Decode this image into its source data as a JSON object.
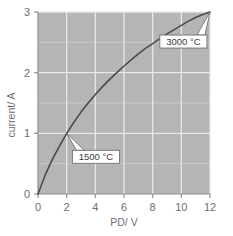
{
  "chart_data": {
    "type": "line",
    "title": "",
    "subtitle": "",
    "xlabel": "PD/ V",
    "ylabel": "current/ A",
    "xlim": [
      0,
      12
    ],
    "ylim": [
      0,
      3
    ],
    "xticks": [
      "0",
      "2",
      "4",
      "6",
      "8",
      "10",
      "12"
    ],
    "xtick_values": [
      0,
      2,
      4,
      6,
      8,
      10,
      12
    ],
    "yticks": [
      "0",
      "1",
      "2",
      "3"
    ],
    "ytick_values": [
      0,
      1,
      2,
      3
    ],
    "y_minor_gridlines": [
      0.5,
      1.5,
      2.5
    ],
    "grid": true,
    "grid_color": "#e8e8e8",
    "plot_background": "#b5b5b5",
    "axis_color": "#8f8f8f",
    "legend": "none",
    "series": [
      {
        "name": "filament lamp I-V characteristic",
        "color": "#4a4a4a",
        "x": [
          0,
          0.5,
          1,
          1.5,
          2,
          2.5,
          3,
          3.5,
          4,
          4.5,
          5,
          5.5,
          6,
          6.5,
          7,
          7.5,
          8,
          8.5,
          9,
          9.5,
          10,
          10.5,
          11,
          11.5,
          12
        ],
        "y": [
          0,
          0.31,
          0.57,
          0.79,
          1.0,
          1.18,
          1.35,
          1.5,
          1.64,
          1.77,
          1.89,
          2.0,
          2.11,
          2.21,
          2.31,
          2.4,
          2.48,
          2.56,
          2.64,
          2.71,
          2.78,
          2.85,
          2.91,
          2.96,
          3.0
        ]
      }
    ],
    "annotations": [
      {
        "id": "anno-1500",
        "label": "1500 °C",
        "point_x": 2,
        "point_y": 1,
        "box_x": 2.4,
        "box_y": 0.72
      },
      {
        "id": "anno-3000",
        "label": "3000 °C",
        "point_x": 12,
        "point_y": 3,
        "box_x": 8.5,
        "box_y": 2.62
      }
    ]
  }
}
